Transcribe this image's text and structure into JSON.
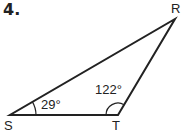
{
  "problem": {
    "number": "4."
  },
  "triangle": {
    "vertices": {
      "S": {
        "label": "S"
      },
      "T": {
        "label": "T"
      },
      "R": {
        "label": "R"
      }
    },
    "angles": {
      "S": "29°",
      "T": "122°"
    }
  }
}
